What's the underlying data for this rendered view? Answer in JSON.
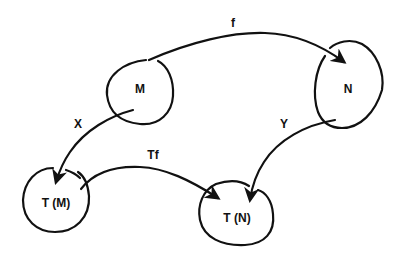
{
  "diagram": {
    "type": "commutative-diagram",
    "nodes": [
      {
        "id": "M",
        "label": "M"
      },
      {
        "id": "N",
        "label": "N"
      },
      {
        "id": "TM",
        "label": "T (M)"
      },
      {
        "id": "TN",
        "label": "T (N)"
      }
    ],
    "edges": [
      {
        "from": "M",
        "to": "N",
        "label": "f"
      },
      {
        "from": "M",
        "to": "TM",
        "label": "X"
      },
      {
        "from": "N",
        "to": "TN",
        "label": "Y"
      },
      {
        "from": "TM",
        "to": "TN",
        "label": "Tf"
      }
    ]
  },
  "colors": {
    "ink": "#111111",
    "background": "#ffffff"
  }
}
